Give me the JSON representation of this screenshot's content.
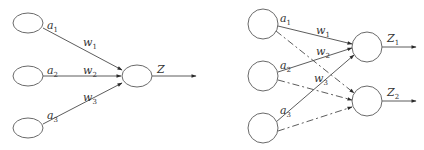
{
  "diagrams": [
    {
      "name": "single-output-perceptron",
      "inputs": [
        {
          "label": "a",
          "sub": "1"
        },
        {
          "label": "a",
          "sub": "2"
        },
        {
          "label": "a",
          "sub": "3"
        }
      ],
      "weights": [
        {
          "label": "w",
          "sub": "1"
        },
        {
          "label": "w",
          "sub": "2"
        },
        {
          "label": "w",
          "sub": "3"
        }
      ],
      "output": {
        "label": "Z",
        "sub": ""
      }
    },
    {
      "name": "two-output-network",
      "inputs": [
        {
          "label": "a",
          "sub": "1"
        },
        {
          "label": "a",
          "sub": "2"
        },
        {
          "label": "a",
          "sub": "3"
        }
      ],
      "weights": [
        {
          "label": "w",
          "sub": "1"
        },
        {
          "label": "w",
          "sub": "2"
        },
        {
          "label": "w",
          "sub": "3"
        }
      ],
      "outputs": [
        {
          "label": "Z",
          "sub": "1"
        },
        {
          "label": "Z",
          "sub": "2"
        }
      ],
      "edge_styles": {
        "to_Z1": "solid",
        "to_Z2": "dash-dot"
      }
    }
  ],
  "colors": {
    "stroke": "#4a4a4a",
    "node_stroke": "#6a6a6a",
    "text": "#333333",
    "background": "#ffffff"
  }
}
